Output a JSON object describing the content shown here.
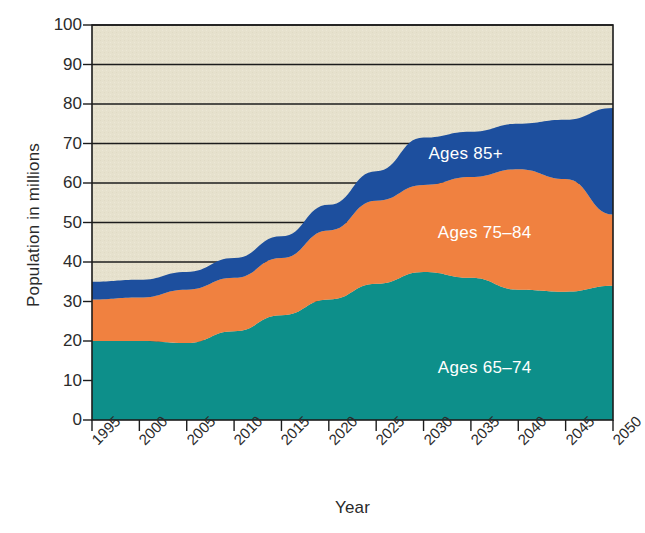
{
  "chart_data": {
    "type": "area",
    "stacked": true,
    "title": "",
    "xlabel": "Year",
    "ylabel": "Population in millions",
    "x": [
      1995,
      2000,
      2005,
      2010,
      2015,
      2020,
      2025,
      2030,
      2035,
      2040,
      2045,
      2050
    ],
    "xlim": [
      1995,
      2050
    ],
    "ylim": [
      0,
      100
    ],
    "ytick_labels": [
      "0",
      "10",
      "20",
      "30",
      "40",
      "50",
      "60",
      "70",
      "80",
      "90",
      "100"
    ],
    "yticks": [
      0,
      10,
      20,
      30,
      40,
      50,
      60,
      70,
      80,
      90,
      100
    ],
    "xtick_labels": [
      "1995",
      "2000",
      "2005",
      "2010",
      "2015",
      "2020",
      "2025",
      "2030",
      "2035",
      "2040",
      "2045",
      "2050"
    ],
    "grid": "horizontal",
    "legend_position": "inline-on-bands",
    "plot_background": "#e6e1cd",
    "series": [
      {
        "name": "Ages 65–74",
        "color": "#0d8f8a",
        "label_x": 2037,
        "label_y": 13,
        "values": [
          20.0,
          20.0,
          19.5,
          22.5,
          26.5,
          30.5,
          34.5,
          37.5,
          36.0,
          33.0,
          32.5,
          34.0
        ]
      },
      {
        "name": "Ages 75–84",
        "color": "#f08140",
        "label_x": 2037,
        "label_y": 47,
        "values": [
          10.5,
          11.0,
          13.5,
          13.5,
          14.5,
          17.5,
          21.0,
          22.0,
          25.5,
          30.5,
          28.5,
          18.0
        ],
        "cumulative": [
          30.5,
          31.0,
          33.0,
          36.0,
          41.0,
          48.0,
          55.5,
          59.5,
          61.5,
          63.5,
          61.0,
          52.0
        ]
      },
      {
        "name": "Ages 85+",
        "color": "#1d4f9e",
        "label_x": 2036,
        "label_y": 67,
        "values": [
          4.5,
          4.5,
          4.5,
          5.0,
          5.5,
          6.5,
          7.5,
          12.0,
          11.5,
          11.5,
          15.0,
          27.0
        ],
        "cumulative": [
          35.0,
          35.5,
          37.5,
          41.0,
          46.5,
          54.5,
          63.0,
          71.5,
          73.0,
          75.0,
          76.0,
          79.0
        ]
      }
    ]
  },
  "axis": {
    "y_title": "Population in millions",
    "x_title": "Year"
  }
}
